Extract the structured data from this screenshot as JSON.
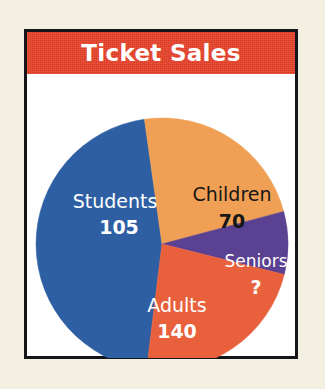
{
  "chart_data": {
    "type": "pie",
    "title": "Ticket Sales",
    "categories": [
      "Students",
      "Children",
      "Seniors",
      "Adults"
    ],
    "values": [
      105,
      70,
      null,
      140
    ],
    "value_labels": [
      "105",
      "70",
      "?",
      "140"
    ],
    "colors": [
      "#2e5fa3",
      "#f0a055",
      "#5b4191",
      "#e8613c"
    ],
    "label_text_colors": [
      "#ffffff",
      "#161616",
      "#ffffff",
      "#ffffff"
    ],
    "slices": [
      {
        "name": "Students",
        "value_label": "105",
        "value": 105,
        "color": "#2e5fa3",
        "text_color": "#ffffff",
        "start_angle": 187,
        "end_angle": 352,
        "label_x": 88,
        "label_y": 128,
        "value_x": 92,
        "value_y": 154
      },
      {
        "name": "Children",
        "value_label": "70",
        "value": 70,
        "color": "#f0a055",
        "text_color": "#161616",
        "start_angle": 352,
        "end_angle": 75,
        "label_x": 205,
        "label_y": 121,
        "value_x": 205,
        "value_y": 148
      },
      {
        "name": "Seniors",
        "value_label": "?",
        "value": null,
        "color": "#5b4191",
        "text_color": "#ffffff",
        "start_angle": 75,
        "end_angle": 104,
        "label_x": 229,
        "label_y": 188,
        "value_x": 229,
        "value_y": 214
      },
      {
        "name": "Adults",
        "value_label": "140",
        "value": 140,
        "color": "#e8613c",
        "text_color": "#ffffff",
        "start_angle": 104,
        "end_angle": 187,
        "label_x": 150,
        "label_y": 232,
        "value_x": 150,
        "value_y": 258
      }
    ],
    "center_x": 135,
    "center_y": 170,
    "radius": 126,
    "legend": "none",
    "grid": false,
    "xlabel": "",
    "ylabel": ""
  },
  "card": {
    "title": "Ticket Sales",
    "title_bar_color": "#e8432a",
    "title_text_color": "#ffffff",
    "background_color": "#ffffff",
    "border_color": "#16161a"
  },
  "page": {
    "background_color": "#f3efe2"
  }
}
